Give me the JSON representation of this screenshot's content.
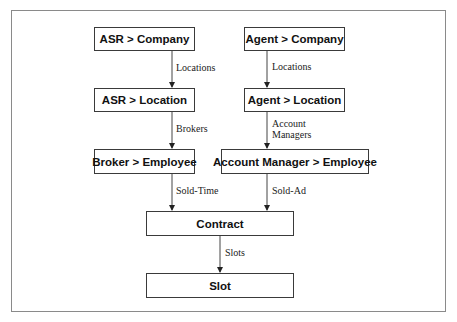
{
  "diagram": {
    "nodes": [
      {
        "id": "asr-company",
        "label": "ASR > Company"
      },
      {
        "id": "asr-location",
        "label": "ASR > Location"
      },
      {
        "id": "agent-company",
        "label": "Agent > Company"
      },
      {
        "id": "agent-location",
        "label": "Agent > Location"
      },
      {
        "id": "broker-employee",
        "label": "Broker > Employee"
      },
      {
        "id": "account-manager-employee",
        "label": "Account Manager > Employee"
      },
      {
        "id": "contract",
        "label": "Contract"
      },
      {
        "id": "slot",
        "label": "Slot"
      }
    ],
    "edges": [
      {
        "from": "asr-company",
        "to": "asr-location",
        "label": "Locations"
      },
      {
        "from": "asr-location",
        "to": "broker-employee",
        "label": "Brokers"
      },
      {
        "from": "agent-company",
        "to": "agent-location",
        "label": "Locations"
      },
      {
        "from": "agent-location",
        "to": "account-manager-employee",
        "label_lines": [
          "Account",
          "Managers"
        ]
      },
      {
        "from": "broker-employee",
        "to": "contract",
        "label": "Sold-Time"
      },
      {
        "from": "account-manager-employee",
        "to": "contract",
        "label": "Sold-Ad"
      },
      {
        "from": "contract",
        "to": "slot",
        "label": "Slots"
      }
    ]
  }
}
